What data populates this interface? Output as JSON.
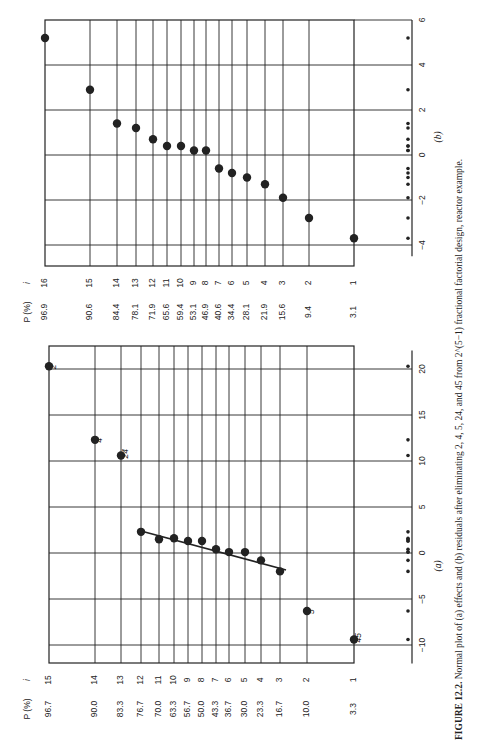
{
  "caption": {
    "label": "FIGURE 12.2.",
    "text": "Normal plot of (a) effects and (b) residuals after eliminating 2, 4, 5, 24, and 45 from 2^(5−1) fractional factorial design, reactor example."
  },
  "chart_data": [
    {
      "type": "scatter",
      "panel": "(a)",
      "title": "Normal plot of effects",
      "xlabel": "(a)",
      "ylabel_p": "P (%)",
      "ylabel_i": "i",
      "xlim": [
        -12,
        22
      ],
      "x_ticks": [
        -10,
        -5,
        0,
        5,
        10,
        15,
        20
      ],
      "grid": true,
      "fitted_line": {
        "from": [
          -2.0,
          16.7
        ],
        "to": [
          2.3,
          76.7
        ]
      },
      "points": [
        {
          "i": 1,
          "p": "3.3",
          "x": -9.4,
          "label": "45"
        },
        {
          "i": 2,
          "p": "10.0",
          "x": -6.3,
          "label": "5"
        },
        {
          "i": 3,
          "p": "16.7",
          "x": -2.0,
          "label": ""
        },
        {
          "i": 4,
          "p": "23.3",
          "x": -0.8,
          "label": ""
        },
        {
          "i": 5,
          "p": "30.0",
          "x": 0.1,
          "label": ""
        },
        {
          "i": 6,
          "p": "36.7",
          "x": 0.1,
          "label": ""
        },
        {
          "i": 7,
          "p": "43.3",
          "x": 0.4,
          "label": ""
        },
        {
          "i": 8,
          "p": "50.0",
          "x": 1.3,
          "label": ""
        },
        {
          "i": 9,
          "p": "56.7",
          "x": 1.3,
          "label": ""
        },
        {
          "i": 10,
          "p": "63.3",
          "x": 1.6,
          "label": ""
        },
        {
          "i": 11,
          "p": "70.0",
          "x": 1.5,
          "label": ""
        },
        {
          "i": 12,
          "p": "76.7",
          "x": 2.3,
          "label": ""
        },
        {
          "i": 13,
          "p": "83.3",
          "x": 10.6,
          "label": "24"
        },
        {
          "i": 14,
          "p": "90.0",
          "x": 12.3,
          "label": "4"
        },
        {
          "i": 15,
          "p": "96.7",
          "x": 20.3,
          "label": "2"
        }
      ]
    },
    {
      "type": "scatter",
      "panel": "(b)",
      "title": "Normal plot of residuals",
      "xlabel": "(b)",
      "ylabel_p": "P (%)",
      "ylabel_i": "i",
      "xlim": [
        -4.5,
        6
      ],
      "x_ticks": [
        -4,
        -2,
        0,
        2,
        4,
        6
      ],
      "grid": true,
      "points": [
        {
          "i": 1,
          "p": "3.1",
          "x": -3.7
        },
        {
          "i": 2,
          "p": "9.4",
          "x": -2.8
        },
        {
          "i": 3,
          "p": "15.6",
          "x": -1.9
        },
        {
          "i": 4,
          "p": "21.9",
          "x": -1.3
        },
        {
          "i": 5,
          "p": "28.1",
          "x": -1.0
        },
        {
          "i": 6,
          "p": "34.4",
          "x": -0.8
        },
        {
          "i": 7,
          "p": "40.6",
          "x": -0.6
        },
        {
          "i": 8,
          "p": "46.9",
          "x": 0.2
        },
        {
          "i": 9,
          "p": "53.1",
          "x": 0.2
        },
        {
          "i": 10,
          "p": "59.4",
          "x": 0.4
        },
        {
          "i": 11,
          "p": "65.6",
          "x": 0.4
        },
        {
          "i": 12,
          "p": "71.9",
          "x": 0.7
        },
        {
          "i": 13,
          "p": "78.1",
          "x": 1.2
        },
        {
          "i": 14,
          "p": "84.4",
          "x": 1.4
        },
        {
          "i": 15,
          "p": "90.6",
          "x": 2.9
        },
        {
          "i": 16,
          "p": "96.9",
          "x": 5.2
        }
      ]
    }
  ],
  "colors": {
    "ink": "#222222",
    "paper": "#ffffff"
  }
}
